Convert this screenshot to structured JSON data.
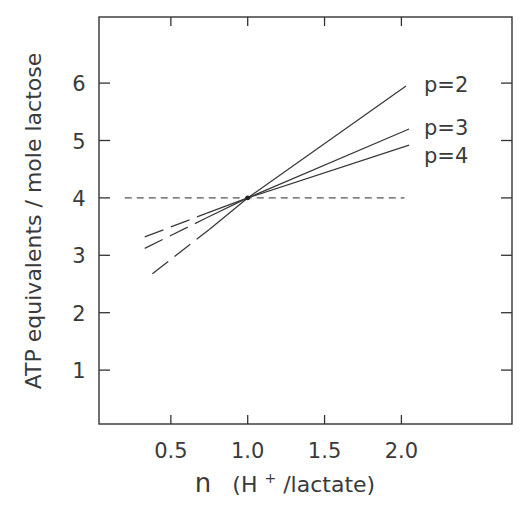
{
  "chart_data": {
    "type": "line",
    "title": "",
    "xlabel": "n (H+/lactate)",
    "xlabel_parts": {
      "main": "n",
      "open": "(H",
      "sup": "+",
      "rest": "/lactate)"
    },
    "ylabel": "ATP equivalents / mole lactose",
    "xlim": [
      0.05,
      2.7
    ],
    "ylim": [
      0,
      7
    ],
    "x_ticks": [
      0.5,
      1.0,
      1.5,
      2.0
    ],
    "x_tick_labels": [
      "0.5",
      "1.0",
      "1.5",
      "2.0"
    ],
    "y_ticks": [
      1,
      2,
      3,
      4,
      5,
      6
    ],
    "y_tick_labels": [
      "1",
      "2",
      "3",
      "4",
      "5",
      "6"
    ],
    "grid": false,
    "legend": "inline labels at right end of lines",
    "reference_line": {
      "y": 4,
      "x_range": [
        0.2,
        2.02
      ],
      "style": "dashed"
    },
    "intersection_point": {
      "x": 1.0,
      "y": 4.0
    },
    "series": [
      {
        "name": "p=2",
        "label": "p=2",
        "x": [
          0.38,
          0.75,
          1.0,
          2.03
        ],
        "y": [
          2.68,
          3.45,
          4.0,
          5.95
        ],
        "dashed_until_x": 0.75
      },
      {
        "name": "p=3",
        "label": "p=3",
        "x": [
          0.33,
          0.73,
          1.0,
          2.05
        ],
        "y": [
          3.12,
          3.65,
          4.0,
          5.2
        ],
        "dashed_until_x": 0.73
      },
      {
        "name": "p=4",
        "label": "p=4",
        "x": [
          0.33,
          0.73,
          1.0,
          2.05
        ],
        "y": [
          3.32,
          3.73,
          4.0,
          4.92
        ],
        "dashed_until_x": 0.73
      }
    ],
    "colors": {
      "line": "#3a3a3a",
      "axis": "#333333",
      "background": "#ffffff"
    }
  }
}
